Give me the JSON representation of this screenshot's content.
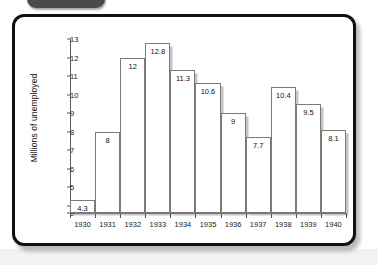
{
  "window": {
    "tab_label": ""
  },
  "chart_data": {
    "type": "bar",
    "title": "",
    "subtitle": "",
    "xlabel": "",
    "ylabel": "Millions of unemployed",
    "categories": [
      "1930",
      "1931",
      "1932",
      "1933",
      "1934",
      "1935",
      "1936",
      "1937",
      "1938",
      "1939",
      "1940"
    ],
    "values": [
      4.3,
      8,
      12,
      12.8,
      11.3,
      10.6,
      9,
      7.7,
      10.4,
      9.5,
      8.1
    ],
    "value_labels": [
      "4.3",
      "8",
      "12",
      "12.8",
      "11.3",
      "10.6",
      "9",
      "7.7",
      "10.4",
      "9.5",
      "8.1"
    ],
    "ylim": [
      3.6,
      13
    ],
    "yticks": [
      0,
      4,
      5,
      6,
      7,
      8,
      9,
      10,
      11,
      12,
      13
    ],
    "ytick_labels": [
      "0",
      "4",
      "5",
      "6",
      "7",
      "8",
      "9",
      "10",
      "11",
      "12",
      "13"
    ],
    "axis_break": true,
    "grid": false,
    "legend": "none",
    "series": [
      {
        "name": "Millions of unemployed",
        "values": [
          4.3,
          8,
          12,
          12.8,
          11.3,
          10.6,
          9,
          7.7,
          10.4,
          9.5,
          8.1
        ]
      }
    ],
    "colors": {
      "bar_fill": "#ffffff",
      "bar_stroke": "#7a7a7a",
      "bar_shadow": "#969696",
      "axis": "#5a5a5a",
      "text": "#111111",
      "card_border": "#111111",
      "tab": "#4a4a4a"
    }
  }
}
